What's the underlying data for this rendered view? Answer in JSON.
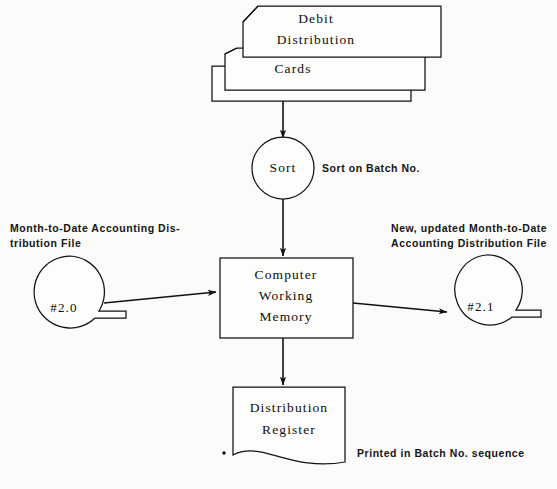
{
  "diagram": {
    "background_color": "#fbfbf9",
    "line_color": "#111111"
  },
  "nodes": {
    "cards": {
      "type": "punched-card-stack",
      "line1": "Debit",
      "line2": "Distribution",
      "line3": "Cards"
    },
    "sort": {
      "type": "manual-operation-circle",
      "label": "Sort",
      "annotation": "Sort on Batch No."
    },
    "input_tape": {
      "type": "magnetic-tape",
      "label": "#2.0",
      "caption_line1": "Month-to-Date  Accounting  Dis-",
      "caption_line2": "tribution File"
    },
    "process": {
      "type": "process-box",
      "line1": "Computer",
      "line2": "Working",
      "line3": "Memory"
    },
    "output_tape": {
      "type": "magnetic-tape",
      "label": "#2.1",
      "caption_line1": "New,   updated   Month-to-Date",
      "caption_line2": "Accounting  Distribution File"
    },
    "report": {
      "type": "document",
      "line1": "Distribution",
      "line2": "Register",
      "annotation": "Printed in Batch No. sequence"
    }
  }
}
